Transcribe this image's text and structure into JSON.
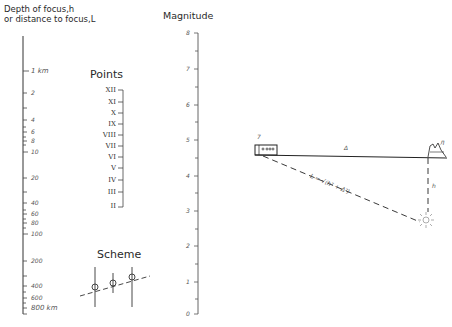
{
  "depth_scale": {
    "title_line1": "Depth of focus,h",
    "title_line2": "or distance to focus,L",
    "labels": [
      {
        "text": "1 km",
        "y": 71
      },
      {
        "text": "2",
        "y": 93
      },
      {
        "text": "4",
        "y": 120
      },
      {
        "text": "6",
        "y": 132
      },
      {
        "text": "8",
        "y": 141
      },
      {
        "text": "10",
        "y": 152
      },
      {
        "text": "20",
        "y": 178
      },
      {
        "text": "40",
        "y": 203
      },
      {
        "text": "60",
        "y": 214
      },
      {
        "text": "80",
        "y": 223
      },
      {
        "text": "100",
        "y": 234
      },
      {
        "text": "200",
        "y": 261
      },
      {
        "text": "400",
        "y": 286
      },
      {
        "text": "600",
        "y": 298
      },
      {
        "text": "800 km",
        "y": 308
      }
    ]
  },
  "points": {
    "heading": "Points",
    "items": [
      "XII",
      "XI",
      "X",
      "IX",
      "VIII",
      "VII",
      "VI",
      "V",
      "IV",
      "III",
      "II"
    ]
  },
  "scheme": {
    "heading": "Scheme"
  },
  "magnitude": {
    "title": "Magnitude",
    "labels": [
      "8",
      "7",
      "6",
      "5",
      "4",
      "3",
      "2",
      "1",
      "0"
    ]
  },
  "geometry": {
    "label_station": "7",
    "label_distance": "Δ",
    "label_formula": "L = √(h² + Δ²)",
    "label_depth": "h",
    "label_epicenter_marker": "Л"
  }
}
